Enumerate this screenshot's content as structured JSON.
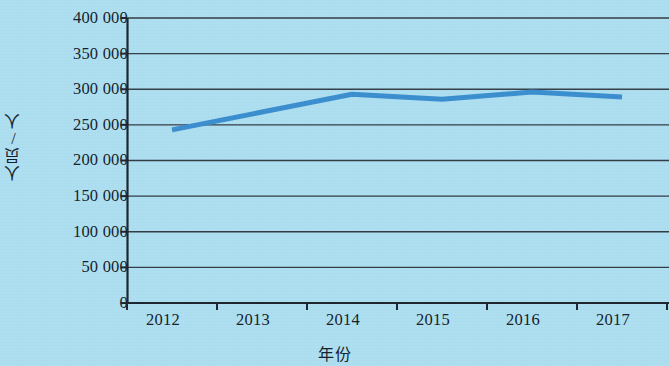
{
  "chart_data": {
    "type": "line",
    "title": "",
    "subtitle": "",
    "xlabel": "年份",
    "ylabel": "人员/人",
    "categories": [
      "2012",
      "2013",
      "2014",
      "2015",
      "2016",
      "2017"
    ],
    "values": [
      243000,
      268000,
      293000,
      286000,
      296000,
      289000
    ],
    "series": [
      {
        "name": "人员",
        "values": [
          243000,
          268000,
          293000,
          286000,
          296000,
          289000
        ],
        "color": "#3a8ed0"
      }
    ],
    "ylim": [
      0,
      400000
    ],
    "yticks": [
      0,
      50000,
      100000,
      150000,
      200000,
      250000,
      300000,
      350000,
      400000
    ],
    "ytick_labels": [
      "0",
      "50 000",
      "100 000",
      "150 000",
      "200 000",
      "250 000",
      "300 000",
      "350 000",
      "400 000"
    ],
    "xtick_labels": [
      "2012",
      "2013",
      "2014",
      "2015",
      "2016",
      "2017"
    ],
    "grid": true,
    "grid_axis": "y",
    "legend": false,
    "legend_position": "none",
    "markers": false,
    "background_color": "#ade0f2",
    "grid_color": "#333b44",
    "axis_color": "#1b242d",
    "text_color": "#14202b",
    "line_width": 5
  }
}
